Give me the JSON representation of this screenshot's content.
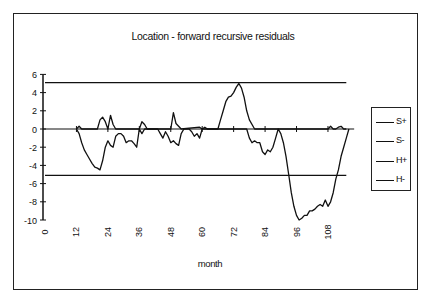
{
  "chart": {
    "title": "Location - forward recursive residuals",
    "xlabel": "month",
    "legend": [
      {
        "label": "S+"
      },
      {
        "label": "S-"
      },
      {
        "label": "H+"
      },
      {
        "label": "H-"
      }
    ],
    "yticks": [
      "6",
      "4",
      "2",
      "0",
      "-2",
      "-4",
      "-6",
      "-8",
      "-10"
    ],
    "xticks": [
      "0",
      "12",
      "24",
      "36",
      "48",
      "60",
      "72",
      "84",
      "96",
      "108"
    ]
  },
  "chart_data": {
    "type": "line",
    "title": "Location - forward recursive residuals",
    "xlabel": "month",
    "ylabel": "",
    "xlim": [
      0,
      118
    ],
    "ylim": [
      -10,
      6
    ],
    "xticks": [
      0,
      12,
      24,
      36,
      48,
      60,
      72,
      84,
      96,
      108
    ],
    "yticks": [
      6,
      4,
      2,
      0,
      -2,
      -4,
      -6,
      -8,
      -10
    ],
    "grid": false,
    "legend_position": "right",
    "series": [
      {
        "name": "S+",
        "x": [
          12,
          13,
          14,
          20,
          21,
          22,
          23,
          24,
          25,
          26,
          27,
          36,
          37,
          38,
          39,
          48,
          49,
          50,
          51,
          52,
          59,
          60,
          61,
          62,
          66,
          67,
          68,
          69,
          70,
          71,
          72,
          73,
          74,
          75,
          76,
          77,
          78,
          80,
          108,
          109,
          110,
          111,
          112,
          113,
          114,
          115
        ],
        "y": [
          0,
          0.3,
          0,
          0,
          1.0,
          1.3,
          0.8,
          0,
          1.5,
          0.5,
          0,
          0,
          0.8,
          0.5,
          0,
          0,
          1.8,
          0.6,
          0.3,
          0,
          0.2,
          0,
          0.2,
          0,
          0,
          1.0,
          2.0,
          3.0,
          3.5,
          3.6,
          4.0,
          4.6,
          5.0,
          4.5,
          3.5,
          2.0,
          1.0,
          0,
          0,
          0.3,
          0,
          0,
          0.2,
          0.3,
          0,
          0
        ]
      },
      {
        "name": "S-",
        "x": [
          12,
          13,
          14,
          15,
          16,
          17,
          18,
          19,
          20,
          21,
          22,
          23,
          24,
          25,
          26,
          27,
          28,
          29,
          30,
          31,
          32,
          33,
          34,
          35,
          36,
          37,
          38,
          43,
          44,
          45,
          46,
          47,
          48,
          49,
          50,
          51,
          52,
          53,
          55,
          56,
          57,
          58,
          59,
          60,
          77,
          78,
          79,
          80,
          81,
          82,
          83,
          84,
          85,
          86,
          87,
          88,
          89,
          90,
          91,
          92,
          93,
          94,
          95,
          96,
          97,
          98,
          99,
          100,
          101,
          102,
          103,
          104,
          105,
          106,
          107,
          108,
          109,
          110,
          111,
          112,
          113,
          114,
          115,
          116
        ],
        "y": [
          0,
          -0.5,
          -1.5,
          -2.3,
          -2.8,
          -3.3,
          -3.8,
          -4.2,
          -4.3,
          -4.5,
          -3.5,
          -2.0,
          -1.3,
          -1.8,
          -2.0,
          -0.8,
          -0.5,
          -0.5,
          -0.8,
          -1.5,
          -1.3,
          -1.3,
          -1.6,
          -2.0,
          0,
          -0.5,
          0,
          0,
          -0.5,
          -1.0,
          -0.3,
          -0.8,
          -1.5,
          -1.3,
          -1.6,
          -1.8,
          -0.5,
          0,
          0,
          -0.3,
          -0.8,
          -0.5,
          -1.0,
          0,
          0,
          -1.0,
          -1.5,
          -1.3,
          -1.5,
          -1.5,
          -2.5,
          -2.8,
          -2.3,
          -2.5,
          -2.0,
          -1.0,
          0,
          -0.5,
          -1.5,
          -3.0,
          -5.0,
          -7.0,
          -8.5,
          -9.5,
          -10.0,
          -9.8,
          -9.5,
          -9.5,
          -9.0,
          -9.0,
          -8.8,
          -8.5,
          -8.3,
          -8.5,
          -7.8,
          -8.5,
          -8.0,
          -7.0,
          -5.5,
          -4.5,
          -3.0,
          -2.0,
          -1.0,
          0
        ]
      },
      {
        "name": "H+",
        "x": [
          0,
          115
        ],
        "y": [
          5.1,
          5.1
        ]
      },
      {
        "name": "H-",
        "x": [
          0,
          115
        ],
        "y": [
          -5.1,
          -5.1
        ]
      }
    ]
  }
}
